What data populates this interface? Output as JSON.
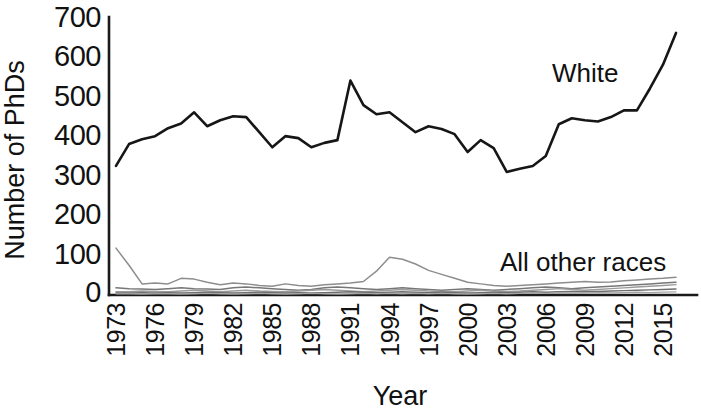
{
  "chart_data": {
    "type": "line",
    "title": "",
    "xlabel": "Year",
    "ylabel": "Number of PhDs",
    "xlim": [
      1973,
      2016
    ],
    "ylim": [
      0,
      700
    ],
    "ytick_labels": [
      "700",
      "600",
      "500",
      "400",
      "300",
      "200",
      "100",
      "0"
    ],
    "ytick_values": [
      700,
      600,
      500,
      400,
      300,
      200,
      100,
      0
    ],
    "xtick_labels": [
      "1973",
      "1976",
      "1979",
      "1982",
      "1985",
      "1988",
      "1991",
      "1994",
      "1997",
      "2000",
      "2003",
      "2006",
      "2009",
      "2012",
      "2015"
    ],
    "xtick_values": [
      1973,
      1976,
      1979,
      1982,
      1985,
      1988,
      1991,
      1994,
      1997,
      2000,
      2003,
      2006,
      2009,
      2012,
      2015
    ],
    "grid": false,
    "legend_position": "inline-annotations",
    "annotations": [
      {
        "text": "White",
        "series": "White",
        "x": 2006,
        "y": 560
      },
      {
        "text": "All other races",
        "series": "All other races",
        "x": 2009,
        "y": 95
      }
    ],
    "x": [
      1973,
      1974,
      1975,
      1976,
      1977,
      1978,
      1979,
      1980,
      1981,
      1982,
      1983,
      1984,
      1985,
      1986,
      1987,
      1988,
      1989,
      1990,
      1991,
      1992,
      1993,
      1994,
      1995,
      1996,
      1997,
      1998,
      1999,
      2000,
      2001,
      2002,
      2003,
      2004,
      2005,
      2006,
      2007,
      2008,
      2009,
      2010,
      2011,
      2012,
      2013,
      2014,
      2015,
      2016
    ],
    "series": [
      {
        "name": "White",
        "color": "#161616",
        "emphasis": "primary",
        "values": [
          325,
          380,
          392,
          400,
          420,
          432,
          460,
          425,
          440,
          450,
          448,
          410,
          372,
          400,
          395,
          372,
          383,
          390,
          540,
          478,
          455,
          460,
          435,
          410,
          425,
          418,
          405,
          360,
          390,
          370,
          310,
          318,
          325,
          350,
          430,
          445,
          440,
          437,
          448,
          465,
          465,
          520,
          580,
          660
        ]
      },
      {
        "name": "All other races (series 1)",
        "color": "#8d8d8d",
        "emphasis": "secondary",
        "values": [
          118,
          75,
          28,
          30,
          28,
          42,
          40,
          32,
          26,
          30,
          28,
          24,
          22,
          28,
          24,
          22,
          26,
          28,
          30,
          34,
          60,
          95,
          90,
          78,
          62,
          52,
          42,
          32,
          28,
          24,
          22,
          24,
          26,
          28,
          30,
          32,
          34,
          32,
          33,
          36,
          38,
          40,
          42,
          45
        ]
      },
      {
        "name": "All other races (series 2)",
        "color": "#777777",
        "emphasis": "secondary",
        "values": [
          18,
          16,
          15,
          14,
          16,
          18,
          16,
          15,
          14,
          18,
          20,
          18,
          16,
          14,
          12,
          14,
          18,
          20,
          18,
          16,
          14,
          16,
          18,
          16,
          14,
          12,
          14,
          16,
          14,
          12,
          14,
          16,
          18,
          20,
          18,
          16,
          18,
          20,
          22,
          24,
          26,
          28,
          30,
          32
        ]
      },
      {
        "name": "All other races (series 3)",
        "color": "#9a9a9a",
        "emphasis": "secondary",
        "values": [
          8,
          8,
          10,
          9,
          8,
          10,
          12,
          10,
          8,
          10,
          12,
          10,
          9,
          8,
          10,
          12,
          14,
          12,
          10,
          8,
          10,
          12,
          14,
          12,
          10,
          9,
          8,
          10,
          12,
          10,
          9,
          10,
          12,
          14,
          16,
          14,
          12,
          14,
          16,
          18,
          20,
          22,
          24,
          26
        ]
      },
      {
        "name": "All other races (series 4)",
        "color": "#6f6f6f",
        "emphasis": "secondary",
        "values": [
          5,
          5,
          6,
          5,
          6,
          5,
          6,
          7,
          6,
          5,
          6,
          7,
          6,
          5,
          6,
          5,
          6,
          7,
          8,
          7,
          6,
          7,
          8,
          7,
          6,
          7,
          6,
          5,
          6,
          7,
          6,
          7,
          8,
          7,
          8,
          9,
          8,
          9,
          10,
          11,
          12,
          13,
          14,
          15
        ]
      },
      {
        "name": "All other races (series 5)",
        "color": "#a5a5a5",
        "emphasis": "secondary",
        "values": [
          3,
          3,
          2,
          3,
          3,
          2,
          3,
          4,
          3,
          2,
          3,
          4,
          3,
          2,
          3,
          4,
          3,
          2,
          3,
          4,
          3,
          4,
          3,
          4,
          3,
          4,
          3,
          2,
          3,
          4,
          3,
          4,
          5,
          4,
          5,
          4,
          5,
          6,
          5,
          6,
          7,
          6,
          7,
          8
        ]
      }
    ]
  },
  "labels": {
    "ylabel": "Number of PhDs",
    "xlabel": "Year",
    "white": "White",
    "all_other_races": "All other races"
  }
}
